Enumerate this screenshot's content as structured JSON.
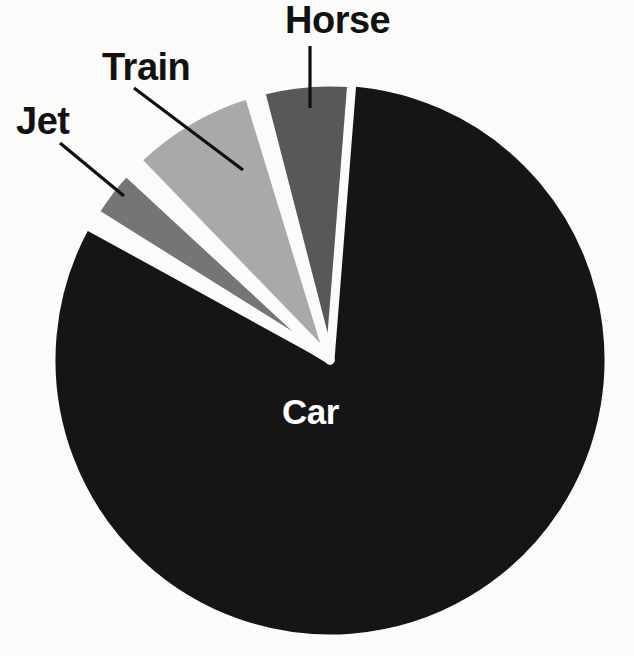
{
  "chart_data": {
    "type": "pie",
    "title": "",
    "subtitle": "",
    "xlabel": "",
    "ylabel": "",
    "legend_position": "none",
    "labels_position": "callout",
    "grid": false,
    "total_degrees": 360,
    "categories": [
      "Car",
      "Horse",
      "Train",
      "Jet"
    ],
    "values": [
      83.0,
      3.0,
      7.5,
      6.5
    ],
    "units": "percent",
    "slices": [
      {
        "name": "Car",
        "label": "Car",
        "value": 83.0,
        "degrees": 298.8,
        "start_angle_deg": 0,
        "end_angle_deg": 298.8,
        "color": "#151515",
        "label_color": "#ffffff",
        "label_placement": "inside",
        "exploded": false,
        "has_leader_line": false
      },
      {
        "name": "Horse",
        "label": "Horse",
        "value": 3.0,
        "degrees": 10.8,
        "start_angle_deg": 302.0,
        "end_angle_deg": 312.8,
        "color": "#757575",
        "label_color": "#121212",
        "label_placement": "outside",
        "exploded": true,
        "has_leader_line": true
      },
      {
        "name": "Train",
        "label": "Train",
        "value": 7.5,
        "degrees": 27.0,
        "start_angle_deg": 316.0,
        "end_angle_deg": 343.0,
        "color": "#a9a9a9",
        "label_color": "#121212",
        "label_placement": "outside",
        "exploded": true,
        "has_leader_line": true
      },
      {
        "name": "Jet",
        "label": "Jet",
        "value": 6.5,
        "degrees": 19.0,
        "start_angle_deg": 345.5,
        "end_angle_deg": 364.5,
        "color": "#585858",
        "label_color": "#121212",
        "label_placement": "outside",
        "exploded": true,
        "has_leader_line": true
      }
    ],
    "geometry": {
      "center_x": 330,
      "center_y": 360,
      "radius": 278,
      "gap_color": "#fbfbfa"
    },
    "leader_lines": [
      {
        "name": "jet-leader",
        "x1": 60,
        "y1": 143,
        "x2": 124,
        "y2": 196
      },
      {
        "name": "train-leader",
        "x1": 134,
        "y1": 88,
        "x2": 243,
        "y2": 170
      },
      {
        "name": "horse-leader",
        "x1": 310,
        "y1": 46,
        "x2": 310,
        "y2": 108
      }
    ],
    "background_color": "#fbfbfa",
    "leader_line_color": "#101010"
  },
  "labels": {
    "jet": "Jet",
    "train": "Train",
    "horse": "Horse",
    "car": "Car"
  }
}
